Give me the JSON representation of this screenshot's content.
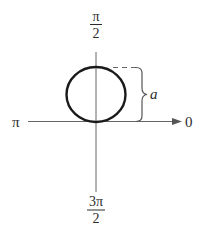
{
  "diagram": {
    "type": "polar-graph",
    "colors": {
      "background": "#ffffff",
      "axis": "#555555",
      "curve": "#1a1a1a",
      "text": "#2b2b2b"
    },
    "axis_labels": {
      "top": {
        "numerator": "π",
        "denominator": "2"
      },
      "bottom": {
        "numerator": "3π",
        "denominator": "2"
      },
      "left": "π",
      "right": "0"
    },
    "annotation": {
      "label": "a",
      "meaning": "diameter of circle (brace from pole to top of circle)"
    },
    "curve": {
      "shape": "circle",
      "center": [
        96,
        94.5
      ],
      "radius_x": 29.5,
      "radius_y": 27.5
    }
  }
}
